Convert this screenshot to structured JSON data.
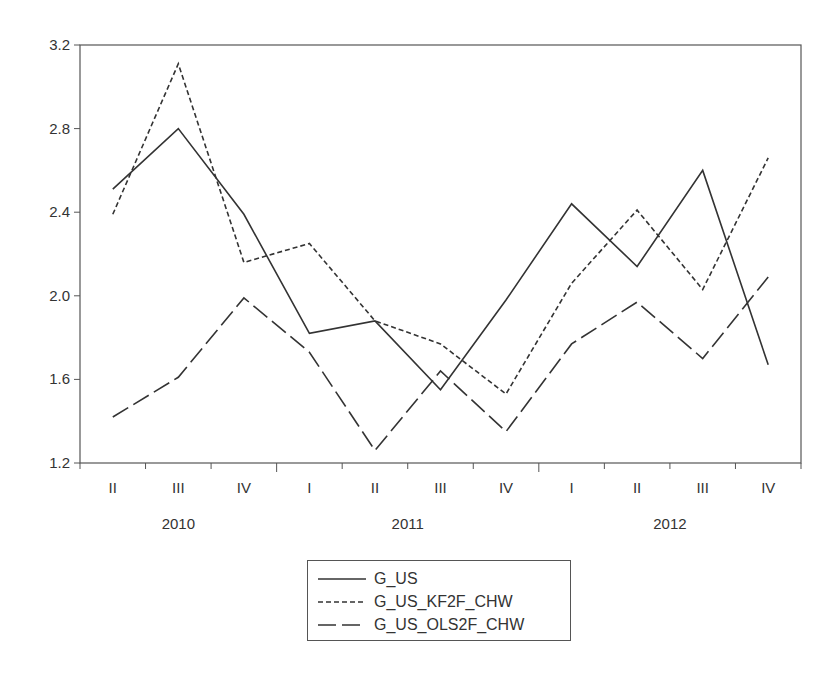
{
  "chart_data": {
    "type": "line",
    "title": "",
    "xlabel": "",
    "ylabel": "",
    "ylim": [
      1.2,
      3.2
    ],
    "yticks": [
      "1.2",
      "1.6",
      "2.0",
      "2.4",
      "2.8",
      "3.2"
    ],
    "grid": false,
    "legend_position": "bottom-center",
    "categories": [
      "II",
      "III",
      "IV",
      "I",
      "II",
      "III",
      "IV",
      "I",
      "II",
      "III",
      "IV"
    ],
    "years": [
      {
        "label": "2010",
        "start_index": 0,
        "end_index": 2
      },
      {
        "label": "2011",
        "start_index": 3,
        "end_index": 6
      },
      {
        "label": "2012",
        "start_index": 7,
        "end_index": 10
      }
    ],
    "x": [
      "2010Q2",
      "2010Q3",
      "2010Q4",
      "2011Q1",
      "2011Q2",
      "2011Q3",
      "2011Q4",
      "2012Q1",
      "2012Q2",
      "2012Q3",
      "2012Q4"
    ],
    "series": [
      {
        "name": "G_US",
        "style": "solid",
        "values": [
          2.51,
          2.8,
          2.39,
          1.82,
          1.88,
          1.55,
          1.98,
          2.44,
          2.14,
          2.6,
          1.67
        ]
      },
      {
        "name": "G_US_KF2F_CHW",
        "style": "short-dash",
        "values": [
          2.39,
          3.11,
          2.16,
          2.25,
          1.88,
          1.77,
          1.53,
          2.06,
          2.41,
          2.03,
          2.66
        ]
      },
      {
        "name": "G_US_OLS2F_CHW",
        "style": "long-dash",
        "values": [
          1.42,
          1.61,
          1.99,
          1.73,
          1.26,
          1.64,
          1.35,
          1.77,
          1.97,
          1.7,
          2.09
        ]
      }
    ]
  },
  "legend": {
    "items": [
      {
        "label": "G_US",
        "dash": ""
      },
      {
        "label": "G_US_KF2F_CHW",
        "dash": "5,3"
      },
      {
        "label": "G_US_OLS2F_CHW",
        "dash": "18,6"
      }
    ]
  },
  "colors": {
    "line": "#333333",
    "axis": "#555555",
    "text": "#333333"
  }
}
